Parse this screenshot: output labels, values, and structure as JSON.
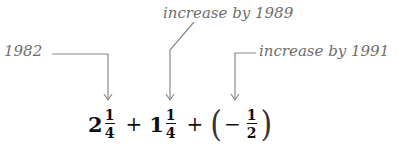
{
  "annotations": [
    {
      "id": "start",
      "text": "1982"
    },
    {
      "id": "increase-1989",
      "text": "increase by 1989"
    },
    {
      "id": "increase-1991",
      "text": "increase by 1991"
    }
  ],
  "equation": {
    "term1": {
      "whole": "2",
      "num": "1",
      "den": "4"
    },
    "op1": "+",
    "term2": {
      "whole": "1",
      "num": "1",
      "den": "4"
    },
    "op2": "+",
    "term3": {
      "open_paren": "(",
      "sign": "−",
      "num": "1",
      "den": "2",
      "close_paren": ")"
    }
  },
  "colors": {
    "annotation": "#6e6e6e",
    "lines": "#8a8a8a",
    "equation": "#111111"
  }
}
